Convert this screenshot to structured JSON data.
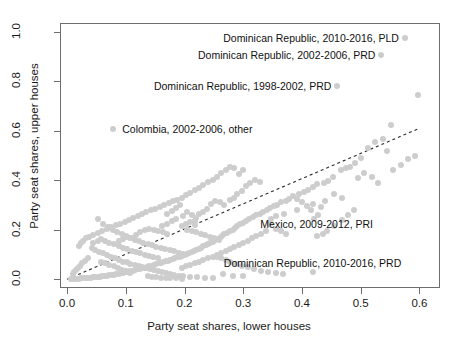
{
  "chart_data": {
    "type": "scatter",
    "title": "",
    "xlabel": "Party seat shares, lower houses",
    "ylabel": "Party seat shares, upper houses",
    "xlim": [
      -0.012,
      0.635
    ],
    "ylim": [
      -0.035,
      1.035
    ],
    "xticks": [
      0.0,
      0.1,
      0.2,
      0.3,
      0.4,
      0.5,
      0.6
    ],
    "xticklabels": [
      "0.0",
      "0.1",
      "0.2",
      "0.3",
      "0.4",
      "0.5",
      "0.6"
    ],
    "yticks": [
      0.0,
      0.2,
      0.4,
      0.6,
      0.8,
      1.0
    ],
    "yticklabels": [
      "0.0",
      "0.2",
      "0.4",
      "0.6",
      "0.8",
      "1.0"
    ],
    "grid": false,
    "legend": null,
    "point_color": "#cdcdcd",
    "point_size": 6,
    "reference_line": {
      "type": "dashed",
      "color": "#2b2b2b",
      "from": [
        0.0,
        0.0
      ],
      "to": [
        0.6,
        0.61
      ],
      "note": "diagonal 45-degree parity line"
    },
    "annotations": [
      {
        "label": "Dominican Republic, 2010-2016, PLD",
        "x": 0.575,
        "y": 0.975,
        "text_anchor": "right-of-point",
        "text_x": 0.565,
        "text_y": 0.975
      },
      {
        "label": "Dominican Republic, 2002-2006, PRD",
        "x": 0.535,
        "y": 0.905,
        "text_anchor": "right-of-point",
        "text_x": 0.525,
        "text_y": 0.905
      },
      {
        "label": "Dominican Republic, 1998-2002, PRD",
        "x": 0.46,
        "y": 0.78,
        "text_anchor": "right-of-point",
        "text_x": 0.45,
        "text_y": 0.78
      },
      {
        "label": "Colombia, 2002-2006, other",
        "x": 0.078,
        "y": 0.605,
        "text_anchor": "left-of-point",
        "text_x": 0.094,
        "text_y": 0.605
      },
      {
        "label": "Mexico, 2009-2012, PRI",
        "x": 0.425,
        "y": 0.175,
        "text_anchor": "above-point",
        "text_x": 0.425,
        "text_y": 0.225
      },
      {
        "label": "Dominican Republic, 2010-2016, PRD",
        "x": 0.418,
        "y": 0.028,
        "text_anchor": "above-point",
        "text_x": 0.418,
        "text_y": 0.065
      }
    ],
    "points": [
      [
        0.575,
        0.975
      ],
      [
        0.535,
        0.905
      ],
      [
        0.46,
        0.78
      ],
      [
        0.078,
        0.605
      ],
      [
        0.425,
        0.175
      ],
      [
        0.418,
        0.028
      ],
      [
        0.598,
        0.745
      ],
      [
        0.552,
        0.625
      ],
      [
        0.538,
        0.565
      ],
      [
        0.525,
        0.555
      ],
      [
        0.512,
        0.532
      ],
      [
        0.545,
        0.52
      ],
      [
        0.5,
        0.49
      ],
      [
        0.49,
        0.47
      ],
      [
        0.482,
        0.455
      ],
      [
        0.475,
        0.448
      ],
      [
        0.467,
        0.44
      ],
      [
        0.505,
        0.43
      ],
      [
        0.52,
        0.415
      ],
      [
        0.495,
        0.408
      ],
      [
        0.53,
        0.39
      ],
      [
        0.452,
        0.412
      ],
      [
        0.445,
        0.398
      ],
      [
        0.438,
        0.39
      ],
      [
        0.425,
        0.385
      ],
      [
        0.418,
        0.372
      ],
      [
        0.41,
        0.36
      ],
      [
        0.403,
        0.352
      ],
      [
        0.395,
        0.345
      ],
      [
        0.455,
        0.345
      ],
      [
        0.468,
        0.33
      ],
      [
        0.44,
        0.315
      ],
      [
        0.418,
        0.305
      ],
      [
        0.432,
        0.292
      ],
      [
        0.385,
        0.335
      ],
      [
        0.378,
        0.325
      ],
      [
        0.372,
        0.318
      ],
      [
        0.365,
        0.312
      ],
      [
        0.358,
        0.3
      ],
      [
        0.352,
        0.295
      ],
      [
        0.345,
        0.288
      ],
      [
        0.34,
        0.28
      ],
      [
        0.392,
        0.278
      ],
      [
        0.37,
        0.262
      ],
      [
        0.355,
        0.255
      ],
      [
        0.348,
        0.245
      ],
      [
        0.333,
        0.272
      ],
      [
        0.328,
        0.265
      ],
      [
        0.322,
        0.258
      ],
      [
        0.316,
        0.25
      ],
      [
        0.31,
        0.242
      ],
      [
        0.305,
        0.235
      ],
      [
        0.3,
        0.228
      ],
      [
        0.295,
        0.222
      ],
      [
        0.29,
        0.215
      ],
      [
        0.286,
        0.208
      ],
      [
        0.282,
        0.2
      ],
      [
        0.278,
        0.195
      ],
      [
        0.272,
        0.188
      ],
      [
        0.268,
        0.182
      ],
      [
        0.264,
        0.175
      ],
      [
        0.26,
        0.168
      ],
      [
        0.256,
        0.162
      ],
      [
        0.252,
        0.158
      ],
      [
        0.248,
        0.152
      ],
      [
        0.244,
        0.147
      ],
      [
        0.24,
        0.142
      ],
      [
        0.236,
        0.138
      ],
      [
        0.232,
        0.133
      ],
      [
        0.228,
        0.128
      ],
      [
        0.224,
        0.124
      ],
      [
        0.22,
        0.12
      ],
      [
        0.216,
        0.116
      ],
      [
        0.212,
        0.112
      ],
      [
        0.208,
        0.108
      ],
      [
        0.204,
        0.104
      ],
      [
        0.2,
        0.1
      ],
      [
        0.196,
        0.096
      ],
      [
        0.192,
        0.092
      ],
      [
        0.188,
        0.089
      ],
      [
        0.184,
        0.086
      ],
      [
        0.18,
        0.082
      ],
      [
        0.176,
        0.079
      ],
      [
        0.172,
        0.076
      ],
      [
        0.168,
        0.073
      ],
      [
        0.164,
        0.07
      ],
      [
        0.16,
        0.067
      ],
      [
        0.156,
        0.064
      ],
      [
        0.152,
        0.061
      ],
      [
        0.148,
        0.058
      ],
      [
        0.144,
        0.055
      ],
      [
        0.14,
        0.052
      ],
      [
        0.136,
        0.05
      ],
      [
        0.132,
        0.047
      ],
      [
        0.128,
        0.045
      ],
      [
        0.124,
        0.042
      ],
      [
        0.12,
        0.04
      ],
      [
        0.116,
        0.038
      ],
      [
        0.112,
        0.035
      ],
      [
        0.108,
        0.033
      ],
      [
        0.104,
        0.031
      ],
      [
        0.1,
        0.029
      ],
      [
        0.096,
        0.027
      ],
      [
        0.092,
        0.025
      ],
      [
        0.088,
        0.023
      ],
      [
        0.084,
        0.021
      ],
      [
        0.08,
        0.019
      ],
      [
        0.076,
        0.018
      ],
      [
        0.072,
        0.016
      ],
      [
        0.068,
        0.015
      ],
      [
        0.064,
        0.013
      ],
      [
        0.06,
        0.012
      ],
      [
        0.056,
        0.011
      ],
      [
        0.052,
        0.01
      ],
      [
        0.048,
        0.009
      ],
      [
        0.044,
        0.008
      ],
      [
        0.04,
        0.007
      ],
      [
        0.036,
        0.006
      ],
      [
        0.032,
        0.005
      ],
      [
        0.028,
        0.005
      ],
      [
        0.024,
        0.004
      ],
      [
        0.02,
        0.003
      ],
      [
        0.016,
        0.003
      ],
      [
        0.012,
        0.002
      ],
      [
        0.009,
        0.002
      ],
      [
        0.006,
        0.001
      ],
      [
        0.053,
        0.245
      ],
      [
        0.062,
        0.225
      ],
      [
        0.07,
        0.212
      ],
      [
        0.078,
        0.2
      ],
      [
        0.085,
        0.19
      ],
      [
        0.093,
        0.182
      ],
      [
        0.1,
        0.175
      ],
      [
        0.108,
        0.168
      ],
      [
        0.115,
        0.16
      ],
      [
        0.122,
        0.155
      ],
      [
        0.13,
        0.148
      ],
      [
        0.137,
        0.142
      ],
      [
        0.145,
        0.138
      ],
      [
        0.152,
        0.132
      ],
      [
        0.16,
        0.128
      ],
      [
        0.167,
        0.122
      ],
      [
        0.175,
        0.118
      ],
      [
        0.182,
        0.113
      ],
      [
        0.19,
        0.108
      ],
      [
        0.197,
        0.104
      ],
      [
        0.205,
        0.2
      ],
      [
        0.212,
        0.195
      ],
      [
        0.22,
        0.19
      ],
      [
        0.228,
        0.185
      ],
      [
        0.235,
        0.178
      ],
      [
        0.243,
        0.172
      ],
      [
        0.25,
        0.165
      ],
      [
        0.258,
        0.158
      ],
      [
        0.198,
        0.255
      ],
      [
        0.205,
        0.27
      ],
      [
        0.212,
        0.258
      ],
      [
        0.22,
        0.248
      ],
      [
        0.185,
        0.29
      ],
      [
        0.192,
        0.3
      ],
      [
        0.178,
        0.275
      ],
      [
        0.17,
        0.262
      ],
      [
        0.245,
        0.305
      ],
      [
        0.252,
        0.318
      ],
      [
        0.26,
        0.312
      ],
      [
        0.268,
        0.3
      ],
      [
        0.238,
        0.285
      ],
      [
        0.232,
        0.272
      ],
      [
        0.225,
        0.262
      ],
      [
        0.218,
        0.235
      ],
      [
        0.29,
        0.345
      ],
      [
        0.298,
        0.358
      ],
      [
        0.285,
        0.33
      ],
      [
        0.278,
        0.322
      ],
      [
        0.305,
        0.375
      ],
      [
        0.312,
        0.39
      ],
      [
        0.32,
        0.4
      ],
      [
        0.328,
        0.395
      ],
      [
        0.3,
        0.44
      ],
      [
        0.292,
        0.425
      ],
      [
        0.285,
        0.45
      ],
      [
        0.278,
        0.455
      ],
      [
        0.27,
        0.44
      ],
      [
        0.262,
        0.428
      ],
      [
        0.255,
        0.415
      ],
      [
        0.248,
        0.4
      ],
      [
        0.24,
        0.395
      ],
      [
        0.232,
        0.38
      ],
      [
        0.225,
        0.37
      ],
      [
        0.218,
        0.36
      ],
      [
        0.21,
        0.35
      ],
      [
        0.203,
        0.34
      ],
      [
        0.195,
        0.33
      ],
      [
        0.188,
        0.322
      ],
      [
        0.18,
        0.315
      ],
      [
        0.173,
        0.308
      ],
      [
        0.165,
        0.3
      ],
      [
        0.158,
        0.292
      ],
      [
        0.15,
        0.285
      ],
      [
        0.143,
        0.278
      ],
      [
        0.135,
        0.27
      ],
      [
        0.128,
        0.262
      ],
      [
        0.12,
        0.255
      ],
      [
        0.113,
        0.248
      ],
      [
        0.105,
        0.24
      ],
      [
        0.098,
        0.232
      ],
      [
        0.09,
        0.225
      ],
      [
        0.083,
        0.218
      ],
      [
        0.075,
        0.21
      ],
      [
        0.068,
        0.202
      ],
      [
        0.06,
        0.195
      ],
      [
        0.053,
        0.188
      ],
      [
        0.045,
        0.18
      ],
      [
        0.038,
        0.172
      ],
      [
        0.032,
        0.165
      ],
      [
        0.028,
        0.155
      ],
      [
        0.024,
        0.145
      ],
      [
        0.02,
        0.135
      ],
      [
        0.042,
        0.125
      ],
      [
        0.048,
        0.118
      ],
      [
        0.055,
        0.112
      ],
      [
        0.062,
        0.105
      ],
      [
        0.068,
        0.098
      ],
      [
        0.075,
        0.092
      ],
      [
        0.082,
        0.085
      ],
      [
        0.088,
        0.078
      ],
      [
        0.095,
        0.072
      ],
      [
        0.102,
        0.068
      ],
      [
        0.108,
        0.062
      ],
      [
        0.115,
        0.058
      ],
      [
        0.122,
        0.053
      ],
      [
        0.128,
        0.048
      ],
      [
        0.135,
        0.044
      ],
      [
        0.142,
        0.04
      ],
      [
        0.148,
        0.036
      ],
      [
        0.155,
        0.032
      ],
      [
        0.162,
        0.028
      ],
      [
        0.168,
        0.025
      ],
      [
        0.175,
        0.022
      ],
      [
        0.182,
        0.018
      ],
      [
        0.19,
        0.015
      ],
      [
        0.198,
        0.012
      ],
      [
        0.21,
        0.01
      ],
      [
        0.222,
        0.008
      ],
      [
        0.235,
        0.006
      ],
      [
        0.248,
        0.005
      ],
      [
        0.265,
        0.02
      ],
      [
        0.282,
        0.015
      ],
      [
        0.3,
        0.012
      ],
      [
        0.035,
        0.085
      ],
      [
        0.03,
        0.075
      ],
      [
        0.026,
        0.065
      ],
      [
        0.022,
        0.055
      ],
      [
        0.018,
        0.045
      ],
      [
        0.015,
        0.038
      ],
      [
        0.012,
        0.03
      ],
      [
        0.01,
        0.022
      ],
      [
        0.058,
        0.072
      ],
      [
        0.065,
        0.065
      ],
      [
        0.072,
        0.058
      ],
      [
        0.08,
        0.052
      ],
      [
        0.086,
        0.045
      ],
      [
        0.094,
        0.038
      ],
      [
        0.1,
        0.032
      ],
      [
        0.107,
        0.026
      ],
      [
        0.045,
        0.148
      ],
      [
        0.052,
        0.155
      ],
      [
        0.058,
        0.162
      ],
      [
        0.065,
        0.155
      ],
      [
        0.072,
        0.148
      ],
      [
        0.08,
        0.142
      ],
      [
        0.088,
        0.135
      ],
      [
        0.095,
        0.128
      ],
      [
        0.102,
        0.122
      ],
      [
        0.11,
        0.115
      ],
      [
        0.118,
        0.11
      ],
      [
        0.125,
        0.105
      ],
      [
        0.132,
        0.1
      ],
      [
        0.14,
        0.095
      ],
      [
        0.147,
        0.09
      ],
      [
        0.155,
        0.085
      ],
      [
        0.345,
        0.225
      ],
      [
        0.355,
        0.205
      ],
      [
        0.365,
        0.195
      ],
      [
        0.372,
        0.185
      ],
      [
        0.338,
        0.195
      ],
      [
        0.33,
        0.185
      ],
      [
        0.322,
        0.175
      ],
      [
        0.315,
        0.165
      ],
      [
        0.308,
        0.155
      ],
      [
        0.3,
        0.145
      ],
      [
        0.292,
        0.138
      ],
      [
        0.285,
        0.13
      ],
      [
        0.278,
        0.122
      ],
      [
        0.27,
        0.115
      ],
      [
        0.262,
        0.108
      ],
      [
        0.255,
        0.1
      ],
      [
        0.248,
        0.092
      ],
      [
        0.24,
        0.085
      ],
      [
        0.232,
        0.078
      ],
      [
        0.225,
        0.072
      ],
      [
        0.218,
        0.065
      ],
      [
        0.21,
        0.058
      ],
      [
        0.202,
        0.052
      ],
      [
        0.195,
        0.045
      ],
      [
        0.455,
        0.215
      ],
      [
        0.468,
        0.24
      ],
      [
        0.478,
        0.26
      ],
      [
        0.488,
        0.28
      ],
      [
        0.442,
        0.195
      ],
      [
        0.435,
        0.185
      ],
      [
        0.428,
        0.26
      ],
      [
        0.42,
        0.245
      ],
      [
        0.415,
        0.28
      ],
      [
        0.408,
        0.295
      ],
      [
        0.4,
        0.312
      ],
      [
        0.392,
        0.325
      ],
      [
        0.555,
        0.44
      ],
      [
        0.568,
        0.46
      ],
      [
        0.58,
        0.485
      ],
      [
        0.592,
        0.5
      ],
      [
        0.162,
        0.215
      ],
      [
        0.17,
        0.225
      ],
      [
        0.178,
        0.235
      ],
      [
        0.185,
        0.245
      ],
      [
        0.195,
        0.215
      ],
      [
        0.202,
        0.225
      ],
      [
        0.21,
        0.232
      ],
      [
        0.218,
        0.218
      ],
      [
        0.118,
        0.18
      ],
      [
        0.125,
        0.19
      ],
      [
        0.132,
        0.198
      ],
      [
        0.14,
        0.205
      ],
      [
        0.148,
        0.2
      ],
      [
        0.155,
        0.195
      ],
      [
        0.163,
        0.19
      ],
      [
        0.17,
        0.182
      ],
      [
        0.088,
        0.155
      ],
      [
        0.095,
        0.162
      ],
      [
        0.102,
        0.17
      ],
      [
        0.11,
        0.165
      ],
      [
        0.255,
        0.092
      ],
      [
        0.262,
        0.085
      ],
      [
        0.27,
        0.078
      ],
      [
        0.278,
        0.07
      ],
      [
        0.288,
        0.062
      ],
      [
        0.298,
        0.055
      ],
      [
        0.308,
        0.048
      ],
      [
        0.318,
        0.042
      ],
      [
        0.33,
        0.035
      ],
      [
        0.342,
        0.03
      ],
      [
        0.355,
        0.025
      ],
      [
        0.368,
        0.022
      ],
      [
        0.138,
        0.012
      ],
      [
        0.145,
        0.01
      ],
      [
        0.152,
        0.008
      ],
      [
        0.16,
        0.007
      ],
      [
        0.168,
        0.006
      ],
      [
        0.176,
        0.005
      ],
      [
        0.185,
        0.004
      ],
      [
        0.195,
        0.003
      ]
    ]
  }
}
